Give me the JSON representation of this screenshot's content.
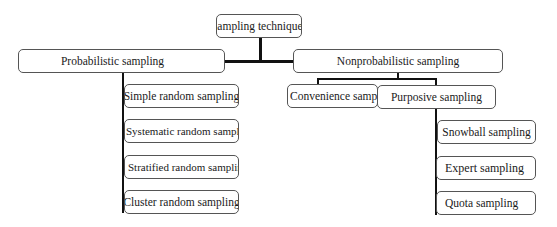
{
  "diagram": {
    "type": "tree",
    "root": {
      "label": "Sampling techniques",
      "children": [
        {
          "label": "Probabilistic sampling",
          "children": [
            {
              "label": "Simple random sampling"
            },
            {
              "label": "Systematic random sampling"
            },
            {
              "label": "Stratified random sampling"
            },
            {
              "label": "Cluster random sampling"
            }
          ]
        },
        {
          "label": "Nonprobabilistic sampling",
          "children": [
            {
              "label": "Convenience sampling"
            },
            {
              "label": "Purposive sampling",
              "children": [
                {
                  "label": "Snowball sampling"
                },
                {
                  "label": "Expert sampling"
                },
                {
                  "label": "Quota sampling"
                }
              ]
            }
          ]
        }
      ]
    }
  },
  "nodes": {
    "root": "Sampling techniques",
    "probabilistic": "Probabilistic sampling",
    "nonprobabilistic": "Nonprobabilistic sampling",
    "simple": "Simple random sampling",
    "systematic": "Systematic random sampling",
    "stratified": "Stratified random sampling",
    "cluster": "Cluster random sampling",
    "convenience": "Convenience sampling",
    "purposive": "Purposive sampling",
    "snowball": "Snowball sampling",
    "expert": "Expert sampling",
    "quota": "Quota sampling"
  },
  "colors": {
    "line": "#111111",
    "box_border": "#555555",
    "background": "#ffffff"
  }
}
